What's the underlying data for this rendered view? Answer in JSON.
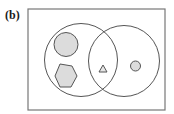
{
  "figure": {
    "panel_label": "(b)",
    "colors": {
      "stroke": "#555555",
      "shape_fill": "#dcdcdc",
      "background": "#ffffff"
    },
    "sets": [
      {
        "name": "left-set",
        "elements": [
          "large-circle",
          "hexagon"
        ]
      },
      {
        "name": "right-set",
        "elements": [
          "small-circle"
        ]
      },
      {
        "name": "intersection",
        "elements": [
          "triangle"
        ]
      }
    ]
  }
}
